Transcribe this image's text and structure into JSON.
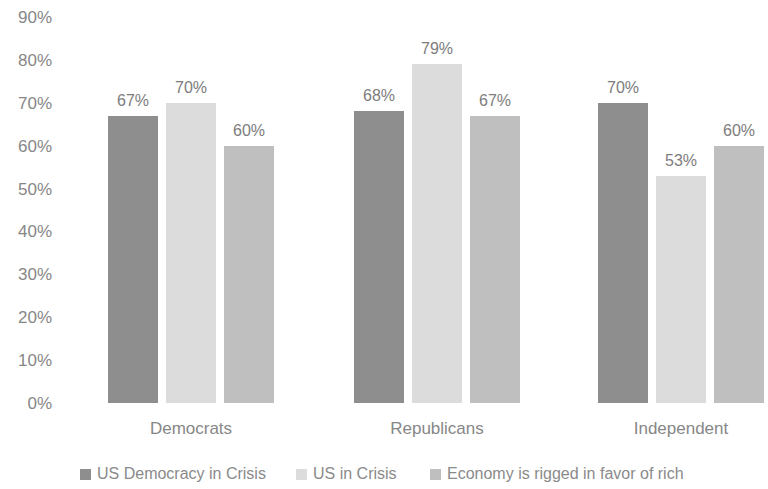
{
  "chart_data": {
    "type": "bar",
    "title": "",
    "subtitle": "",
    "xlabel": "",
    "ylabel": "",
    "categories": [
      "Democrats",
      "Republicans",
      "Independent"
    ],
    "series": [
      {
        "name": "US Democracy in Crisis",
        "color": "#8e8e8e",
        "values": [
          67,
          68,
          70
        ],
        "labels": [
          "67%",
          "68%",
          "70%"
        ]
      },
      {
        "name": "US in Crisis",
        "color": "#dcdcdc",
        "values": [
          70,
          79,
          53
        ],
        "labels": [
          "70%",
          "79%",
          "53%"
        ]
      },
      {
        "name": "Economy is rigged in favor of rich",
        "color": "#bfbfbf",
        "values": [
          60,
          67,
          60
        ],
        "labels": [
          "60%",
          "67%",
          "60%"
        ]
      }
    ],
    "group_values": [
      {
        "category": "Democrats",
        "values": [
          67,
          68,
          70
        ]
      },
      {
        "category": "Republicans",
        "values": [
          70,
          79,
          53
        ]
      },
      {
        "category": "Independent",
        "values": [
          60,
          67,
          60
        ]
      }
    ],
    "ylim": [
      0,
      90
    ],
    "ytick_step": 10,
    "ytick_labels": [
      "90%",
      "80%",
      "70%",
      "60%",
      "50%",
      "40%",
      "30%",
      "20%",
      "10%",
      "0%"
    ],
    "ytick_values": [
      90,
      80,
      70,
      60,
      50,
      40,
      30,
      20,
      10,
      0
    ],
    "grid": false,
    "legend_position": "bottom",
    "value_labels_shown": true,
    "background_color": "#ffffff",
    "text_color": "#878787"
  },
  "legend": {
    "items": [
      {
        "label": "US Democracy in Crisis",
        "color": "#8e8e8e"
      },
      {
        "label": "US in Crisis",
        "color": "#dcdcdc"
      },
      {
        "label": "Economy is rigged in favor of rich",
        "color": "#bfbfbf"
      }
    ]
  }
}
